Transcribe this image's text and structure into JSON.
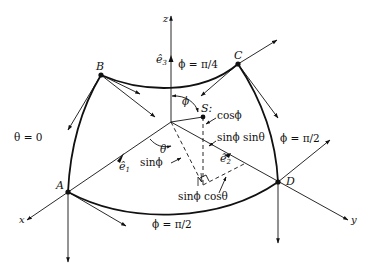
{
  "diagram": {
    "type": "spherical-octant-coordinates",
    "axes": {
      "x": "x",
      "y": "y",
      "z": "z"
    },
    "unit_vectors": {
      "e1": "ê",
      "e1_sub": "1",
      "e2": "ê",
      "e2_sub": "2",
      "e3": "ê",
      "e3_sub": "3"
    },
    "points": {
      "A": "A",
      "B": "B",
      "C": "C",
      "D": "D",
      "S": "S:"
    },
    "curve_labels": {
      "theta_zero": "θ = 0",
      "phi_pi4": "ϕ = π/4",
      "phi_pi2_right": "ϕ = π/2",
      "phi_pi2_bottom": "ϕ = π/2"
    },
    "angle_labels": {
      "phi": "ϕ",
      "theta": "θ"
    },
    "component_labels": {
      "cos_phi": "cosϕ",
      "sin_phi_sin_theta": "sinϕ sinθ",
      "sin_phi": "sinϕ",
      "sin_phi_cos_theta": "sinϕ cosθ"
    },
    "colors": {
      "ink": "#111111",
      "background": "#ffffff"
    }
  }
}
